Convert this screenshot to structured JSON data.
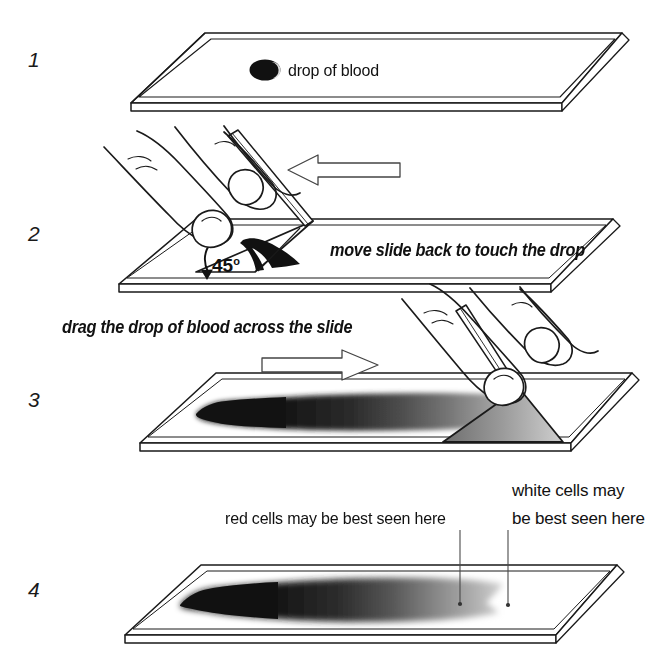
{
  "figure": {
    "background_color": "#ffffff",
    "ink_color": "#111111"
  },
  "steps": [
    {
      "number": "1",
      "caption": "drop of blood",
      "description": "A drop of blood placed near one end of a clean glass slide."
    },
    {
      "number": "2",
      "caption": "move slide back to touch the drop",
      "angle_label": "45",
      "angle_unit": "o",
      "arrow_direction": "left",
      "description": "A second spreader slide held at 45 degrees is drawn back until it touches the drop, which spreads along the contact edge."
    },
    {
      "number": "3",
      "caption": "drag the drop of blood across the slide",
      "arrow_direction": "right",
      "description": "The spreader slide is pushed forward, dragging the blood into a thin film."
    },
    {
      "number": "4",
      "annotations": [
        {
          "text": "red cells may be best seen here"
        },
        {
          "text_line_1": "white cells may",
          "text_line_2": "be best seen here"
        }
      ],
      "description": "The finished smear shows a dense head fading to a feathered tail."
    }
  ],
  "colors": {
    "blood_dark": "#111111",
    "blood_mid": "#6f6f6f",
    "blood_light": "#c9c9c9",
    "outline": "#1a1a1a",
    "leader_line": "#4a4a4a"
  }
}
